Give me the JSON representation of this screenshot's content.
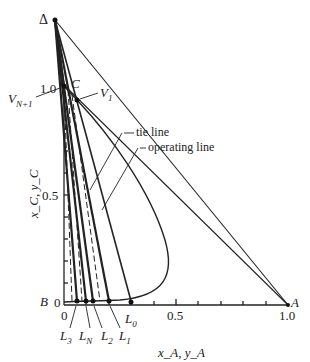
{
  "diagram": {
    "type": "triangular-extraction-diagram",
    "axes": {
      "y_label": "x_C, y_C",
      "x_label": "x_A, y_A",
      "y_ticks": [
        "0",
        "0.5",
        "1.0"
      ],
      "x_ticks": [
        "0",
        "0.5",
        "1.0"
      ]
    },
    "points": {
      "delta": "Δ",
      "C": "C",
      "B": "B",
      "A": "A",
      "V_N1": "V",
      "V_N1_sub": "N+1",
      "V_1": "V",
      "V_1_sub": "1",
      "L_3": "L",
      "L_3_sub": "3",
      "L_N": "L",
      "L_N_sub": "N",
      "L_2": "L",
      "L_2_sub": "2",
      "L_1": "L",
      "L_1_sub": "1",
      "L_0": "L",
      "L_0_sub": "0"
    },
    "annotations": {
      "tie_line": "tie line",
      "operating_line": "operating line"
    },
    "origin_label": "0"
  }
}
